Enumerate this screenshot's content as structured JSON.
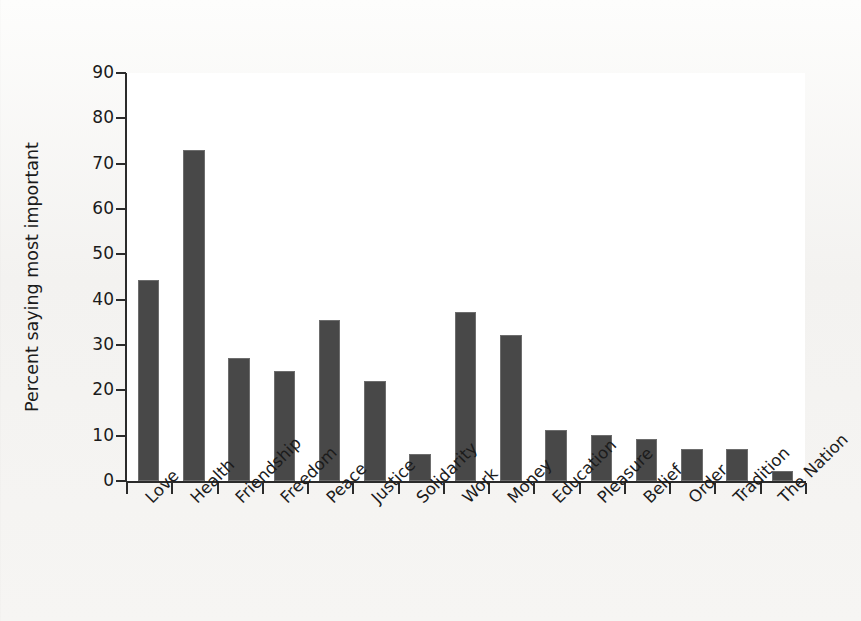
{
  "figure": {
    "background_color": "#f3f2f0",
    "plot_background_color": "#ffffff",
    "axis_color": "#2b2b2b",
    "bar_color": "#484848",
    "bar_edge_color": "#6d6d6d"
  },
  "chart_data": {
    "type": "bar",
    "title": "",
    "xlabel": "",
    "ylabel": "Percent saying most important",
    "ylim": [
      0,
      90
    ],
    "yticks": [
      0,
      10,
      20,
      30,
      40,
      50,
      60,
      70,
      80,
      90
    ],
    "ytick_labels": [
      "0",
      "10",
      "20",
      "30",
      "40",
      "50",
      "60",
      "70",
      "80",
      "90"
    ],
    "grid": false,
    "legend": false,
    "legend_position": "none",
    "orientation": "vertical",
    "categories": [
      "Love",
      "Health",
      "Friendship",
      "Freedom",
      "Peace",
      "Justice",
      "Solidarity",
      "Work",
      "Money",
      "Education",
      "Pleasure",
      "Belief",
      "Order",
      "Tradition",
      "The Nation"
    ],
    "values": [
      44.4,
      73.1,
      27.1,
      24.2,
      35.5,
      22.1,
      6.0,
      37.3,
      32.3,
      11.2,
      10.2,
      9.2,
      7.1,
      7.0,
      2.1
    ],
    "xtick_style": "between-bars",
    "xtick_label_rotation": -45
  }
}
